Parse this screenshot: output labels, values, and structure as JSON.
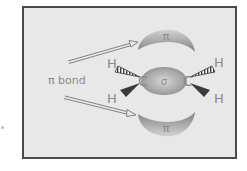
{
  "diagram": {
    "labels": {
      "pi_top": "π",
      "pi_bottom": "π",
      "sigma": "σ",
      "carbon_left": "C",
      "carbon_right": "C",
      "h_left_top": "H",
      "h_left_bottom": "H",
      "h_right_top": "H",
      "h_right_bottom": "H",
      "pi_bond": "π bond"
    },
    "colors": {
      "frame_border": "#4a4a4a",
      "frame_fill": "#e8e8e8",
      "lobe_dark": "#8c8c8c",
      "lobe_light": "#cfcfcf",
      "text": "#8a8a8a",
      "wedge": "#3a3a3a"
    }
  }
}
